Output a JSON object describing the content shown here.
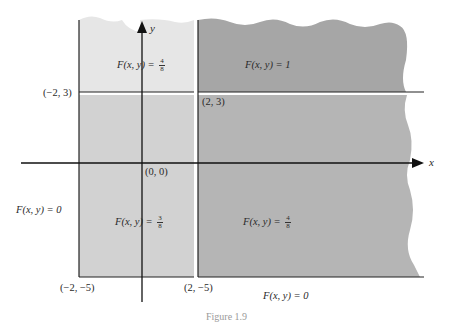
{
  "figure": {
    "caption_partial": "Figure 1.9",
    "colors": {
      "region_top_left": "#e6e6e6",
      "region_top_right": "#a6a6a6",
      "region_bottom_left": "#d2d2d2",
      "region_bottom_right": "#b5b5b5",
      "boundary_lines": "#222222",
      "background": "#ffffff"
    },
    "axes": {
      "x_label": "x",
      "y_label": "y",
      "origin_label": "(0, 0)"
    },
    "points": {
      "p_neg2_3": "(−2, 3)",
      "p_2_3": "(2, 3)",
      "p_neg2_neg5": "(−2, −5)",
      "p_2_neg5": "(2, −5)"
    },
    "regions": {
      "top_left": {
        "prefix": "F(x, y) = ",
        "num": "4",
        "den": "8"
      },
      "top_right": {
        "text": "F(x, y) = 1"
      },
      "bottom_left": {
        "prefix": "F(x, y) = ",
        "num": "3",
        "den": "8"
      },
      "bottom_right": {
        "prefix": "F(x, y) = ",
        "num": "4",
        "den": "8"
      },
      "outside_left": {
        "text": "F(x, y) = 0"
      },
      "outside_bottom": {
        "text": "F(x, y) = 0"
      }
    }
  }
}
